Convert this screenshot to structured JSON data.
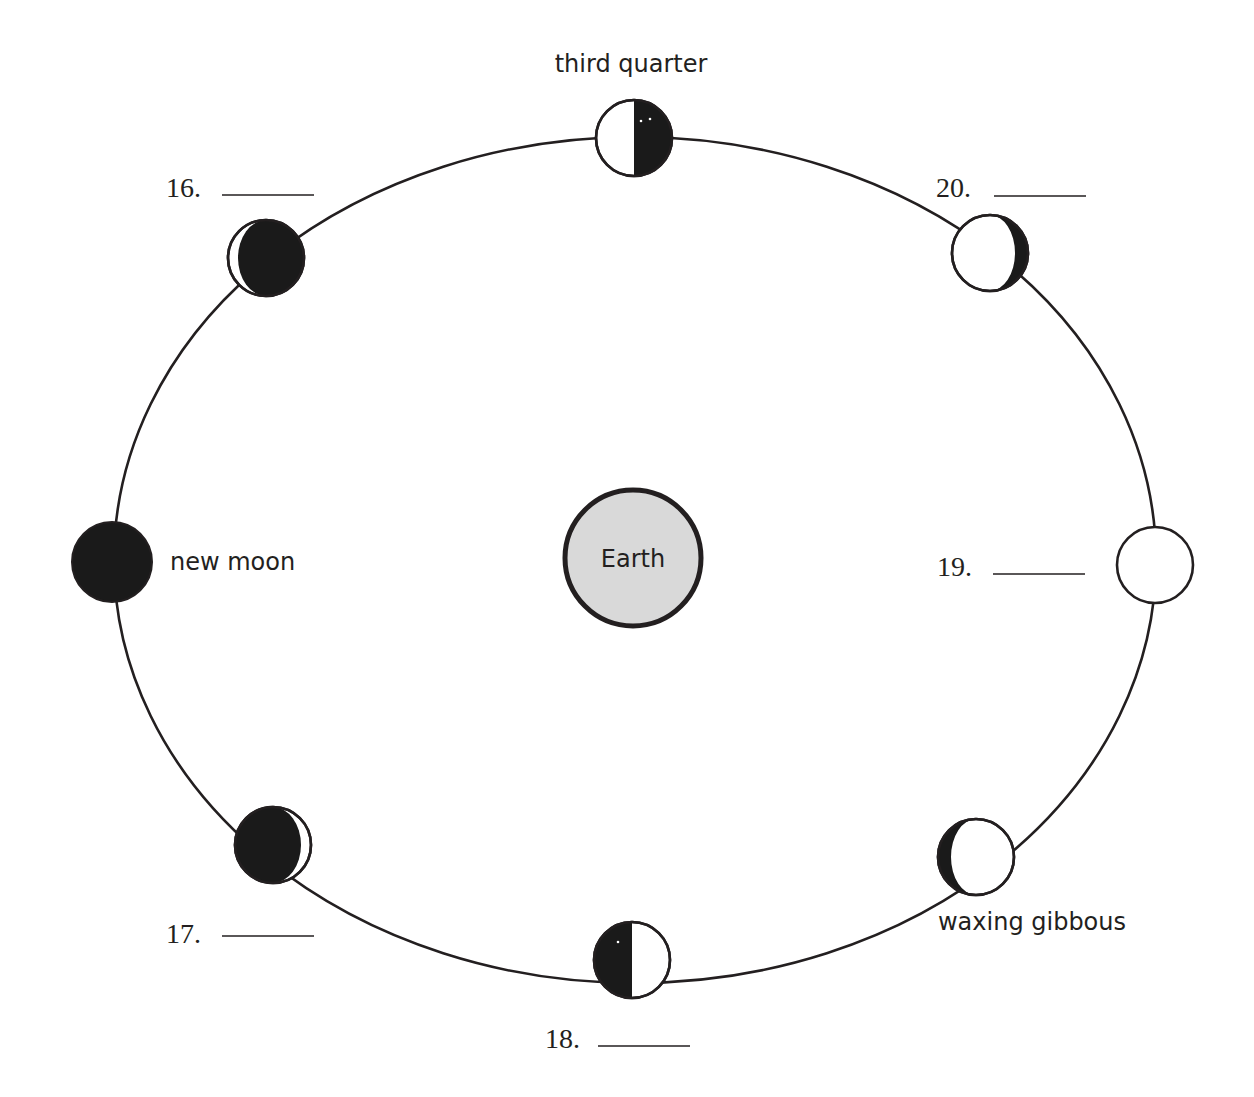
{
  "diagram": {
    "colors": {
      "line": "#231f20",
      "dark_side": "#1a1a1a",
      "lit_side": "#ffffff",
      "earth_fill": "#d9d9d9"
    },
    "orbit": {
      "cx": 635,
      "cy": 560,
      "rx": 521,
      "ry": 423
    },
    "earth": {
      "label": "Earth",
      "cx": 633,
      "cy": 558,
      "r": 68
    },
    "phases": [
      {
        "id": "top",
        "position": "top",
        "label": "third quarter",
        "cx": 634,
        "cy": 138,
        "r": 38,
        "question": null
      },
      {
        "id": "top-left",
        "position": "upper-left",
        "label": null,
        "cx": 266,
        "cy": 258,
        "r": 38,
        "question": "16."
      },
      {
        "id": "left",
        "position": "left",
        "label": "new moon",
        "cx": 112,
        "cy": 562,
        "r": 40,
        "question": null
      },
      {
        "id": "bottom-left",
        "position": "lower-left",
        "label": null,
        "cx": 273,
        "cy": 845,
        "r": 38,
        "question": "17."
      },
      {
        "id": "bottom",
        "position": "bottom",
        "label": null,
        "cx": 632,
        "cy": 960,
        "r": 38,
        "question": "18."
      },
      {
        "id": "bottom-right",
        "position": "lower-right",
        "label": "waxing gibbous",
        "cx": 976,
        "cy": 857,
        "r": 38,
        "question": null
      },
      {
        "id": "right",
        "position": "right",
        "label": null,
        "cx": 1155,
        "cy": 565,
        "r": 38,
        "question": "19."
      },
      {
        "id": "top-right",
        "position": "upper-right",
        "label": null,
        "cx": 990,
        "cy": 253,
        "r": 38,
        "question": "20."
      }
    ],
    "labels": {
      "third_quarter": "third quarter",
      "new_moon": "new moon",
      "waxing_gibbous": "waxing gibbous",
      "q16": "16.",
      "q17": "17.",
      "q18": "18.",
      "q19": "19.",
      "q20": "20."
    }
  }
}
